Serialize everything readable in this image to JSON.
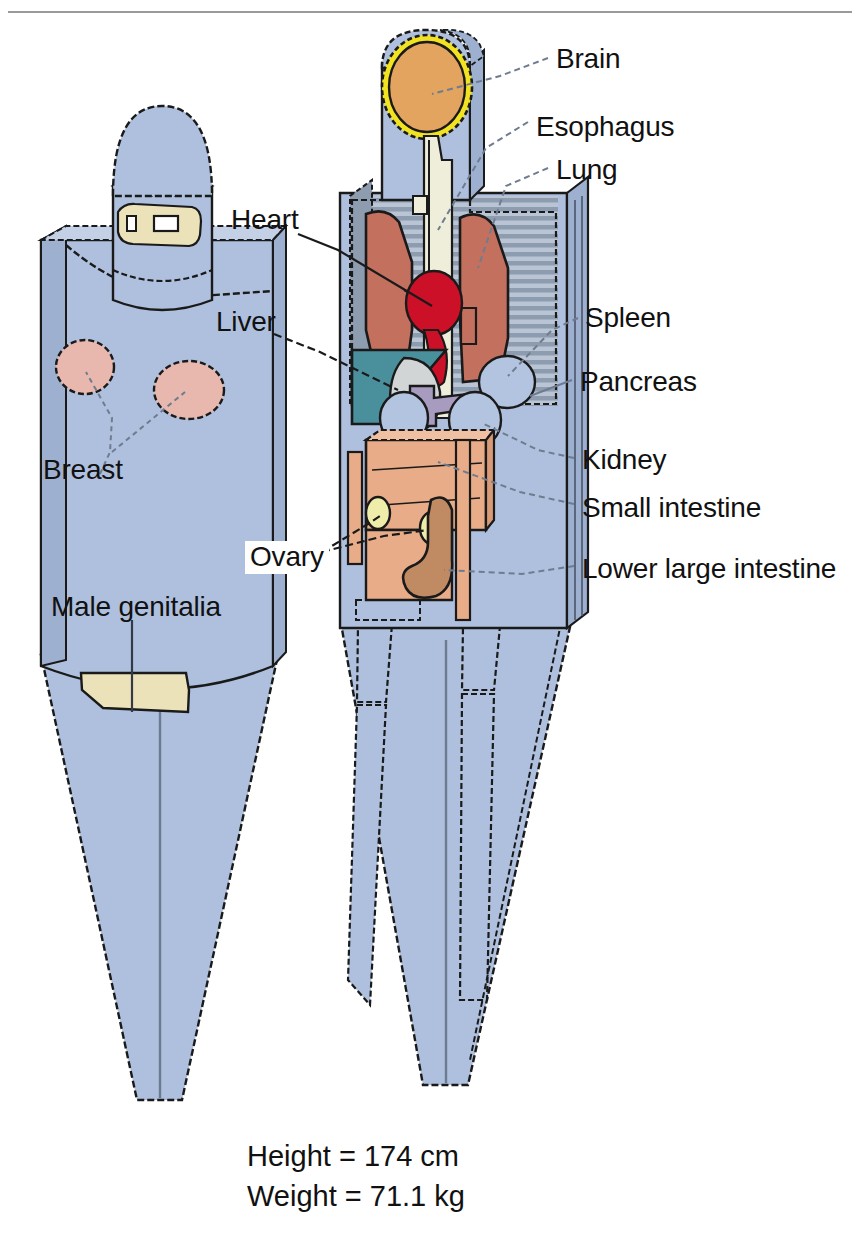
{
  "figure": {
    "type": "anatomical-phantom-diagram",
    "top_rule_color": "#9a9a9a",
    "background": "#ffffff"
  },
  "labels": [
    {
      "id": "brain",
      "text": "Brain",
      "x": 556,
      "y": 44
    },
    {
      "id": "esophagus",
      "text": "Esophagus",
      "x": 536,
      "y": 112
    },
    {
      "id": "lung",
      "text": "Lung",
      "x": 556,
      "y": 155
    },
    {
      "id": "heart",
      "text": "Heart",
      "x": 231,
      "y": 205
    },
    {
      "id": "liver",
      "text": "Liver",
      "x": 216,
      "y": 307
    },
    {
      "id": "spleen",
      "text": "Spleen",
      "x": 585,
      "y": 303
    },
    {
      "id": "pancreas",
      "text": "Pancreas",
      "x": 580,
      "y": 367
    },
    {
      "id": "breast",
      "text": "Breast",
      "x": 43,
      "y": 455
    },
    {
      "id": "kidney",
      "text": "Kidney",
      "x": 582,
      "y": 445
    },
    {
      "id": "small-intestine",
      "text": "Small intestine",
      "x": 582,
      "y": 493
    },
    {
      "id": "ovary",
      "text": "Ovary",
      "x": 245,
      "y": 541,
      "boxed": true
    },
    {
      "id": "lower-large-intestine",
      "text": "Lower large intestine",
      "x": 582,
      "y": 554
    },
    {
      "id": "male-genitalia",
      "text": "Male genitalia",
      "x": 51,
      "y": 592
    }
  ],
  "caption": {
    "height_line": "Height = 174 cm",
    "weight_line": "Weight = 71.1 kg",
    "x": 247,
    "y": 1137
  },
  "colors": {
    "body_blue": "#aec0dd",
    "body_blue_shade": "#9db0d0",
    "body_blue_dark": "#8fa5c8",
    "outline": "#1a1a1a",
    "brain_orange": "#e2a45e",
    "skull_yellow": "#f2e322",
    "lung_red": "#c4705f",
    "heart_crimson": "#cc1028",
    "liver_teal": "#4a909c",
    "stomach_grey": "#d2d5d6",
    "pancreas_lavender": "#a89bc0",
    "spleen_blue": "#b3c4e0",
    "kidney_blue": "#b3c4e0",
    "small_intestine_peach": "#e8ac88",
    "large_intestine_tan": "#c08a63",
    "ovary_pale_yellow": "#eeeeaa",
    "breast_pink": "#e8b8ae",
    "genitalia_cream": "#ece2ba",
    "esophagus_cream": "#efeedb",
    "rib_grey": "#aab4c4",
    "rule_grey": "#9a9a9a"
  }
}
